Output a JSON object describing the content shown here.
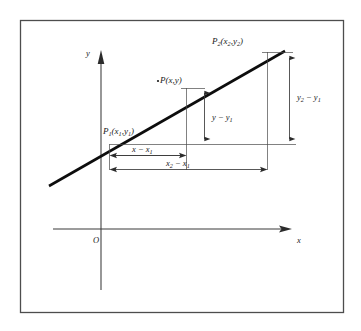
{
  "figure": {
    "kind": "geometry-diagram",
    "frame": {
      "color": "#4d4d4d"
    },
    "axes": {
      "x_label": "x",
      "y_label": "y",
      "origin_label": "O",
      "x_axis_name": "x-axis",
      "y_axis_name": "y-axis"
    },
    "points": [
      {
        "id": "P1",
        "label_P": "P",
        "label_sub": "1",
        "label_coords": "(x",
        "label_coords_sub1": "1",
        "label_coords_mid": ",y",
        "label_coords_sub2": "1",
        "label_coords_close": ")",
        "full": "P₁(x₁,y₁)"
      },
      {
        "id": "P",
        "label_P": "P",
        "label_sub": "",
        "label_coords": "(x",
        "label_coords_sub1": "",
        "label_coords_mid": ",y",
        "label_coords_sub2": "",
        "label_coords_close": ")",
        "full": "P(x,y)"
      },
      {
        "id": "P2",
        "label_P": "P",
        "label_sub": "2",
        "label_coords": "(x",
        "label_coords_sub1": "2",
        "label_coords_mid": ",y",
        "label_coords_sub2": "2",
        "label_coords_close": ")",
        "full": "P₂(x₂,y₂)"
      }
    ],
    "dimensions": [
      {
        "id": "dy-inner",
        "orientation": "vertical",
        "base": "y",
        "sub": "",
        "minus": "−",
        "term2": "y",
        "term2sub": "1",
        "full": "y − y₁"
      },
      {
        "id": "dy-outer",
        "orientation": "vertical",
        "base": "y",
        "sub": "2",
        "minus": "−",
        "term2": "y",
        "term2sub": "1",
        "full": "y₂ − y₁"
      },
      {
        "id": "dx-inner",
        "orientation": "horizontal",
        "base": "x",
        "sub": "",
        "minus": "−",
        "term2": "x",
        "term2sub": "1",
        "full": "x − x₁"
      },
      {
        "id": "dx-outer",
        "orientation": "horizontal",
        "base": "x",
        "sub": "2",
        "minus": "−",
        "term2": "x",
        "term2sub": "1",
        "full": "x₂ − x₁"
      }
    ]
  }
}
